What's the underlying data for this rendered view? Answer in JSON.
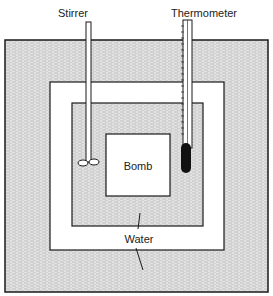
{
  "diagram": {
    "labels": {
      "stirrer": "Stirrer",
      "thermometer": "Thermometer",
      "bomb": "Bomb",
      "water": "Water"
    },
    "colors": {
      "line": "#1a1a1a",
      "water_fill": "#d8d8d8",
      "background": "#ffffff",
      "bulb": "#111111"
    }
  }
}
